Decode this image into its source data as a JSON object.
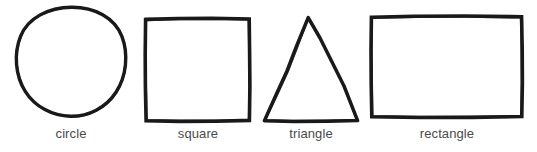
{
  "page": {
    "background_color": "#ffffff",
    "ink_color": "#1a1a1a",
    "label_color": "#4a4a4a",
    "width": 537,
    "height": 152
  },
  "figures": [
    {
      "id": "circle",
      "label": "circle",
      "shape": "circle",
      "icon": "circle-outline-icon",
      "stroke_style": "hand-drawn",
      "bounds": {
        "x": 16,
        "y": 6,
        "width": 109,
        "height": 111
      }
    },
    {
      "id": "square",
      "label": "square",
      "shape": "square",
      "icon": "square-outline-icon",
      "stroke_style": "hand-drawn",
      "bounds": {
        "x": 145,
        "y": 18,
        "width": 105,
        "height": 102
      }
    },
    {
      "id": "triangle",
      "label": "triangle",
      "shape": "triangle",
      "icon": "triangle-outline-icon",
      "stroke_style": "hand-drawn",
      "bounds": {
        "x": 264,
        "y": 17,
        "width": 94,
        "height": 103
      }
    },
    {
      "id": "rectangle",
      "label": "rectangle",
      "shape": "rectangle",
      "icon": "rectangle-outline-icon",
      "stroke_style": "hand-drawn",
      "bounds": {
        "x": 371,
        "y": 16,
        "width": 150,
        "height": 100
      }
    }
  ]
}
